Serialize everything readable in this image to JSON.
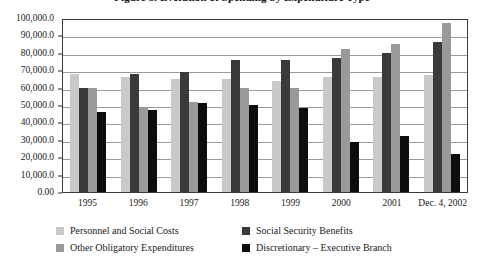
{
  "figure": {
    "title": "Figure 3. Evolution of Spending by Expenditure Type"
  },
  "legend": {
    "position": "bottom",
    "entries": [
      {
        "label": "Personnel and Social Costs",
        "color": "#c9c9c9",
        "swatch_name": "legend-swatch-personnel"
      },
      {
        "label": "Social Security Benefits",
        "color": "#3a3a3a",
        "swatch_name": "legend-swatch-social-security"
      },
      {
        "label": "Other Obligatory Expenditures",
        "color": "#9a9a9a",
        "swatch_name": "legend-swatch-other-obligatory"
      },
      {
        "label": "Discretionary – Executive Branch",
        "color": "#0d0d0d",
        "swatch_name": "legend-swatch-discretionary"
      }
    ]
  },
  "chart_data": {
    "type": "bar",
    "title": "Figure 3. Evolution of Spending by Expenditure Type",
    "xlabel": "",
    "ylabel": "",
    "ylim": [
      0,
      100000
    ],
    "grid": true,
    "legend_position": "bottom",
    "categories": [
      "1995",
      "1996",
      "1997",
      "1998",
      "1999",
      "2000",
      "2001",
      "Dec. 4, 2002"
    ],
    "ytick_labels": [
      "100,000.0",
      "90,000.0",
      "80,000.0",
      "70,000.0",
      "60,000.0",
      "50,000.0",
      "40,000.0",
      "30,000.0",
      "20,000.0",
      "10,000.0",
      "0.00"
    ],
    "ytick_values": [
      100000,
      90000,
      80000,
      70000,
      60000,
      50000,
      40000,
      30000,
      20000,
      10000,
      0
    ],
    "series": [
      {
        "name": "Personnel and Social Costs",
        "color": "#c9c9c9",
        "values": [
          68000,
          66000,
          65000,
          65000,
          64000,
          66000,
          66000,
          67000
        ]
      },
      {
        "name": "Social Security Benefits",
        "color": "#3a3a3a",
        "values": [
          60000,
          68000,
          69000,
          76000,
          76000,
          77000,
          80000,
          86000
        ]
      },
      {
        "name": "Other Obligatory Expenditures",
        "color": "#9a9a9a",
        "values": [
          60000,
          48000,
          52000,
          60000,
          60000,
          82000,
          85000,
          97000
        ]
      },
      {
        "name": "Discretionary – Executive Branch",
        "color": "#0d0d0d",
        "values": [
          46000,
          47000,
          51000,
          50000,
          48000,
          29000,
          32000,
          22000
        ]
      }
    ]
  }
}
